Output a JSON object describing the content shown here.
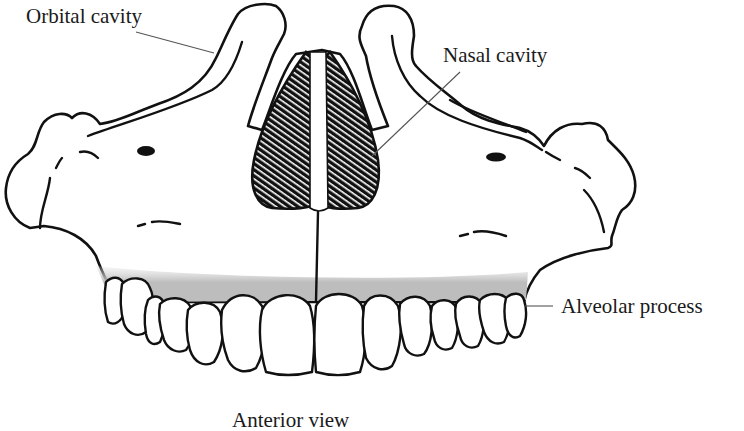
{
  "figure": {
    "view_caption": "Anterior view",
    "labels": {
      "orbital_cavity": "Orbital cavity",
      "nasal_cavity": "Nasal cavity",
      "alveolar_process": "Alveolar process"
    },
    "colors": {
      "outline": "#111111",
      "leader_line": "#555555",
      "alveolar_shading": "#bdbdbd",
      "background": "#ffffff"
    }
  }
}
